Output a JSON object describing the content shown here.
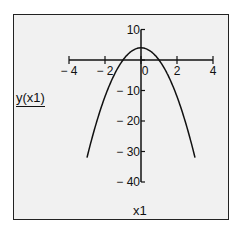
{
  "chart_data": {
    "type": "line",
    "title": "",
    "xlabel": "x1",
    "ylabel": "y(x1)",
    "xlim": [
      -4,
      4
    ],
    "ylim": [
      -40,
      10
    ],
    "x_ticks": [
      -4,
      -2,
      0,
      2,
      4
    ],
    "y_ticks": [
      10,
      0,
      -10,
      -20,
      -30,
      -40
    ],
    "x_tick_labels": [
      "− 4",
      "− 2",
      "0",
      "2",
      "4"
    ],
    "y_tick_labels": [
      "10",
      "",
      "− 10",
      "− 20",
      "− 30",
      "− 40"
    ],
    "grid": false,
    "legend": null,
    "series": [
      {
        "name": "y(x1)",
        "formula_estimate": "y = 4 - 4*x1^2",
        "x": [
          -3,
          -2.5,
          -2,
          -1.5,
          -1,
          -0.5,
          0,
          0.5,
          1,
          1.5,
          2,
          2.5,
          3
        ],
        "y": [
          -32,
          -21,
          -12,
          -5,
          0,
          3,
          4,
          3,
          0,
          -5,
          -12,
          -21,
          -32
        ]
      }
    ]
  },
  "labels": {
    "x_axis": "x1",
    "y_axis": "y(x1)"
  },
  "colors": {
    "background": "#f1f1f1",
    "line": "#111111",
    "border": "#222222"
  }
}
